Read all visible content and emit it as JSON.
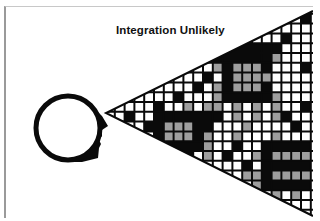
{
  "title": "Integration Unlikely",
  "colors": {
    "black": "#0a0a0a",
    "gray": "#9e9e9e",
    "white": "#ffffff",
    "frame": "#9a9a9a"
  },
  "head": {
    "cx": 68,
    "cy": 128,
    "r": 32,
    "icon": "head-profile-icon"
  },
  "cone": {
    "apex": [
      106,
      113
    ],
    "top": [
      313,
      11
    ],
    "bottom": [
      313,
      216
    ]
  },
  "grid": {
    "x0": 105,
    "y0": 4,
    "pitch": 9.8,
    "cols": 22,
    "rows": 22,
    "legend": {
      "0": "white",
      "1": "black",
      "2": "gray"
    },
    "cells": [
      [
        0,
        0,
        0,
        0,
        0,
        0,
        0,
        0,
        0,
        0,
        0,
        0,
        0,
        0,
        0,
        0,
        0,
        0,
        0,
        0,
        0,
        0
      ],
      [
        0,
        0,
        0,
        0,
        0,
        0,
        0,
        0,
        0,
        0,
        0,
        0,
        0,
        0,
        0,
        0,
        0,
        0,
        0,
        0,
        1,
        0
      ],
      [
        0,
        0,
        0,
        0,
        0,
        0,
        0,
        0,
        0,
        0,
        0,
        0,
        0,
        0,
        0,
        0,
        0,
        0,
        0,
        0,
        0,
        0
      ],
      [
        0,
        0,
        0,
        0,
        0,
        0,
        0,
        0,
        0,
        0,
        0,
        0,
        0,
        0,
        0,
        0,
        0,
        0,
        1,
        0,
        0,
        0
      ],
      [
        0,
        0,
        0,
        0,
        0,
        0,
        0,
        0,
        0,
        0,
        0,
        0,
        1,
        1,
        1,
        1,
        1,
        1,
        0,
        0,
        0,
        0
      ],
      [
        0,
        0,
        0,
        0,
        0,
        0,
        0,
        0,
        0,
        0,
        0,
        1,
        1,
        1,
        1,
        1,
        1,
        2,
        0,
        0,
        0,
        0
      ],
      [
        0,
        0,
        0,
        0,
        0,
        0,
        0,
        0,
        0,
        0,
        0,
        2,
        1,
        2,
        2,
        2,
        1,
        0,
        0,
        0,
        1,
        0
      ],
      [
        0,
        0,
        0,
        0,
        0,
        0,
        0,
        0,
        0,
        0,
        1,
        0,
        1,
        2,
        2,
        2,
        2,
        0,
        0,
        0,
        0,
        0
      ],
      [
        0,
        0,
        0,
        0,
        0,
        0,
        0,
        0,
        0,
        1,
        0,
        2,
        1,
        2,
        2,
        2,
        1,
        0,
        0,
        0,
        0,
        0
      ],
      [
        0,
        0,
        0,
        0,
        0,
        0,
        0,
        1,
        0,
        0,
        0,
        2,
        1,
        1,
        1,
        1,
        1,
        2,
        0,
        0,
        0,
        0
      ],
      [
        0,
        0,
        0,
        0,
        0,
        1,
        0,
        0,
        2,
        0,
        2,
        2,
        0,
        2,
        0,
        2,
        0,
        2,
        0,
        0,
        1,
        0
      ],
      [
        0,
        0,
        1,
        0,
        0,
        1,
        1,
        1,
        1,
        1,
        1,
        1,
        0,
        2,
        0,
        2,
        0,
        2,
        1,
        0,
        0,
        0
      ],
      [
        0,
        0,
        0,
        0,
        1,
        1,
        2,
        2,
        2,
        1,
        1,
        0,
        0,
        0,
        2,
        0,
        0,
        0,
        0,
        1,
        0,
        0
      ],
      [
        0,
        0,
        0,
        1,
        0,
        1,
        2,
        2,
        2,
        1,
        2,
        0,
        0,
        2,
        0,
        0,
        0,
        2,
        0,
        0,
        0,
        0
      ],
      [
        0,
        0,
        0,
        0,
        0,
        1,
        1,
        1,
        1,
        1,
        2,
        0,
        0,
        1,
        0,
        0,
        1,
        1,
        1,
        1,
        1,
        0
      ],
      [
        0,
        0,
        0,
        0,
        0,
        1,
        0,
        0,
        1,
        0,
        2,
        0,
        1,
        0,
        0,
        2,
        1,
        2,
        2,
        2,
        2,
        0
      ],
      [
        0,
        0,
        0,
        0,
        0,
        0,
        0,
        1,
        2,
        0,
        0,
        0,
        0,
        0,
        1,
        0,
        1,
        1,
        1,
        1,
        1,
        0
      ],
      [
        0,
        0,
        0,
        0,
        0,
        0,
        0,
        0,
        0,
        0,
        1,
        0,
        0,
        0,
        2,
        2,
        1,
        2,
        2,
        2,
        2,
        0
      ],
      [
        0,
        0,
        0,
        0,
        0,
        0,
        0,
        0,
        0,
        0,
        0,
        0,
        1,
        0,
        0,
        2,
        1,
        1,
        1,
        1,
        1,
        0
      ],
      [
        0,
        0,
        0,
        0,
        0,
        0,
        0,
        0,
        0,
        0,
        0,
        0,
        0,
        0,
        0,
        1,
        0,
        2,
        0,
        2,
        0,
        0
      ],
      [
        0,
        0,
        0,
        0,
        0,
        0,
        0,
        0,
        0,
        0,
        0,
        0,
        0,
        0,
        0,
        0,
        1,
        0,
        0,
        0,
        0,
        0
      ],
      [
        0,
        0,
        0,
        0,
        0,
        0,
        0,
        0,
        0,
        0,
        0,
        0,
        0,
        0,
        0,
        0,
        0,
        0,
        0,
        0,
        0,
        0
      ]
    ]
  }
}
